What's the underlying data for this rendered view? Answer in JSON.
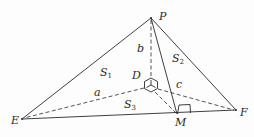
{
  "diagram": {
    "type": "tetrahedron-geometry",
    "points": {
      "P": {
        "label": "P",
        "x": 151,
        "y": 18
      },
      "E": {
        "label": "E",
        "x": 22,
        "y": 119
      },
      "F": {
        "label": "F",
        "x": 236,
        "y": 110
      },
      "M": {
        "label": "M",
        "x": 178,
        "y": 115
      },
      "D": {
        "label": "D",
        "x": 151,
        "y": 85
      }
    },
    "edge_labels": {
      "a": "a",
      "b": "b",
      "c": "c"
    },
    "face_labels": {
      "S1": {
        "main": "S",
        "sub": "1"
      },
      "S2": {
        "main": "S",
        "sub": "2"
      },
      "S3": {
        "main": "S",
        "sub": "3"
      }
    },
    "solid_edges": [
      "PE",
      "PF",
      "EF",
      "PM"
    ],
    "dashed_edges": [
      "PD",
      "DE",
      "DF",
      "DM"
    ],
    "right_angle_at": "M"
  }
}
